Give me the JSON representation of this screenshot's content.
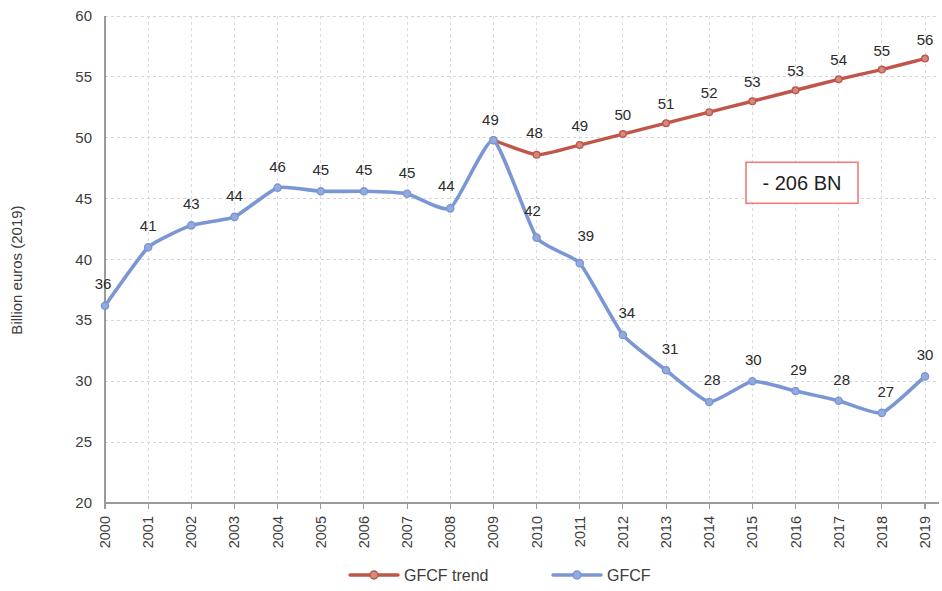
{
  "chart_data": {
    "type": "line",
    "title": "",
    "xlabel": "",
    "ylabel": "Billion euros (2019)",
    "ylim": [
      20,
      60
    ],
    "ytick_step": 5,
    "yticks": [
      "20",
      "25",
      "30",
      "35",
      "40",
      "45",
      "50",
      "55",
      "60"
    ],
    "grid": true,
    "legend_position": "bottom",
    "x": [
      2000,
      2001,
      2002,
      2003,
      2004,
      2005,
      2006,
      2007,
      2008,
      2009,
      2010,
      2011,
      2012,
      2013,
      2014,
      2015,
      2016,
      2017,
      2018,
      2019
    ],
    "categories": [
      "2000",
      "2001",
      "2002",
      "2003",
      "2004",
      "2005",
      "2006",
      "2007",
      "2008",
      "2009",
      "2010",
      "2011",
      "2012",
      "2013",
      "2014",
      "2015",
      "2016",
      "2017",
      "2018",
      "2019"
    ],
    "series": [
      {
        "name": "GFCF trend",
        "color": "#c0564a",
        "x": [
          2009,
          2010,
          2011,
          2012,
          2013,
          2014,
          2015,
          2016,
          2017,
          2018,
          2019
        ],
        "values": [
          49.8,
          48.6,
          49.4,
          50.3,
          51.2,
          52.1,
          53.0,
          53.9,
          54.8,
          55.6,
          56.5
        ],
        "labels": [
          "",
          "48",
          "49",
          "50",
          "51",
          "52",
          "53",
          "53",
          "54",
          "55",
          "56"
        ]
      },
      {
        "name": "GFCF",
        "color": "#7b96d4",
        "x": [
          2000,
          2001,
          2002,
          2003,
          2004,
          2005,
          2006,
          2007,
          2008,
          2009,
          2010,
          2011,
          2012,
          2013,
          2014,
          2015,
          2016,
          2017,
          2018,
          2019
        ],
        "values": [
          36.2,
          41.0,
          42.8,
          43.5,
          45.9,
          45.6,
          45.6,
          45.4,
          44.2,
          49.8,
          41.8,
          39.7,
          33.8,
          30.9,
          28.3,
          30.0,
          29.2,
          28.4,
          27.4,
          30.4
        ],
        "labels": [
          "36",
          "41",
          "43",
          "44",
          "46",
          "45",
          "45",
          "45",
          "44",
          "49",
          "42",
          "39",
          "34",
          "31",
          "28",
          "30",
          "29",
          "28",
          "27",
          "30"
        ]
      }
    ],
    "annotation": {
      "text": "- 206 BN",
      "border_color": "#ef7b7b",
      "x_value": 2016.15,
      "y_value": 46.3
    }
  },
  "legend": {
    "items": [
      {
        "label": "GFCF trend",
        "color": "#c0564a"
      },
      {
        "label": "GFCF",
        "color": "#7b96d4"
      }
    ]
  }
}
